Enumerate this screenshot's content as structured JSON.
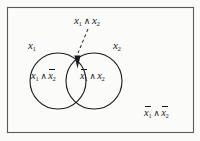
{
  "figure": {
    "kind": "venn-diagram",
    "background_color": "#fbfbfa",
    "ink_color": "#19191b",
    "border_color": "#5a5a5c"
  },
  "universe": {
    "name": "universe-rectangle",
    "x": 7,
    "y": 7,
    "width": 187,
    "height": 126
  },
  "sets": [
    {
      "name": "set-x1",
      "label": "x",
      "subscript": "1",
      "cx": 58,
      "cy": 81,
      "r": 28
    },
    {
      "name": "set-x2",
      "label": "x",
      "subscript": "2",
      "cx": 94,
      "cy": 81,
      "r": 28
    }
  ],
  "regions": {
    "left_only": {
      "term_a": "x",
      "sub_a": "1",
      "operator": "∧",
      "term_b": "x",
      "sub_b": "2",
      "negate_a": false,
      "negate_b": true
    },
    "right_only": {
      "term_a": "x",
      "sub_a": "1",
      "operator": "∧",
      "term_b": "x",
      "sub_b": "2",
      "negate_a": true,
      "negate_b": false
    },
    "intersection": {
      "term_a": "x",
      "sub_a": "1",
      "operator": "∧",
      "term_b": "x",
      "sub_b": "2",
      "negate_a": false,
      "negate_b": false
    },
    "neither": {
      "term_a": "x",
      "sub_a": "1",
      "operator": "∧",
      "term_b": "x",
      "sub_b": "2",
      "negate_a": true,
      "negate_b": true
    }
  },
  "annotation": {
    "name": "intersection-leader",
    "style": "dashed",
    "from_x": 88,
    "from_y": 29,
    "to_x": 77,
    "to_y": 55,
    "arrow": "down-triangle"
  }
}
